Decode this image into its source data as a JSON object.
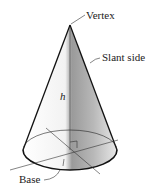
{
  "figure": {
    "type": "cone",
    "labels": {
      "vertex": "Vertex",
      "slant_side": "Slant side",
      "height": "h",
      "base": "Base"
    }
  },
  "colors": {
    "outline": "#111111",
    "shade_light": "#f4f4f4",
    "shade_dark": "#8a8a8a",
    "text": "#222222"
  }
}
